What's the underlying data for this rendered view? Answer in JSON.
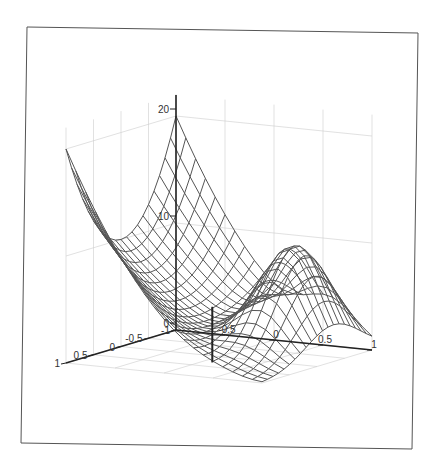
{
  "chart_data": {
    "type": "surface",
    "title": "",
    "xlabel": "",
    "ylabel": "",
    "zlabel": "",
    "x_axis": {
      "ticks": [
        -1,
        -0.5,
        0,
        0.5,
        1
      ],
      "tick_labels": [
        "-1",
        "-0.5",
        "0",
        "0.5",
        "1"
      ],
      "range": [
        -1,
        1
      ]
    },
    "y_axis": {
      "ticks": [
        -0.5,
        0,
        0.5,
        1
      ],
      "tick_labels": [
        "-0.5",
        "0",
        "0.5",
        "1"
      ],
      "range": [
        -1,
        1
      ]
    },
    "z_axis": {
      "ticks": [
        0,
        10,
        20
      ],
      "tick_labels": [
        "0",
        "10",
        "20"
      ],
      "range": [
        0,
        22
      ]
    },
    "grid": true,
    "legend": null,
    "mesh_resolution": 21,
    "surface_description": "Wireframe mesh: high ridge (~20) along the back edge at both corners with U-shaped dip (~10) in the middle, valley near 0 at center, and a hump (~10) on the right side.",
    "marker_stem": {
      "x": 0.3,
      "y": 0.1,
      "z_top": 3
    }
  },
  "frame": {
    "color": "#555555"
  },
  "colors": {
    "mesh": "#555555",
    "grid": "#cccccc",
    "axis": "#222222",
    "background": "#ffffff"
  }
}
